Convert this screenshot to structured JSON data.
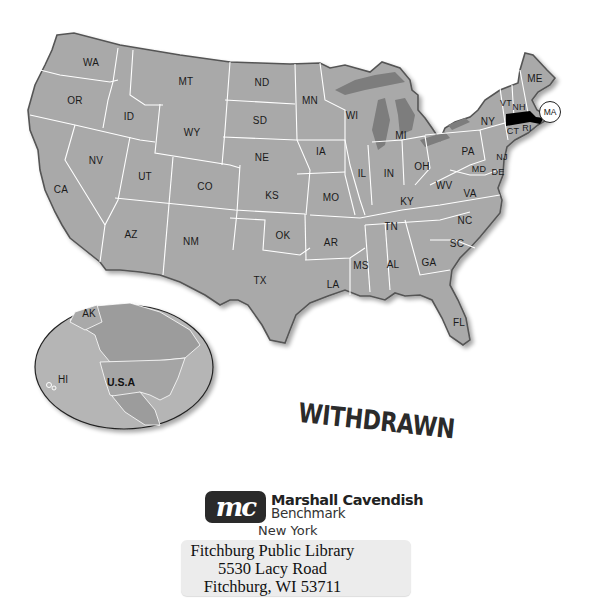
{
  "map": {
    "title": "United States",
    "states": [
      {
        "abbr": "WA",
        "x": 91,
        "y": 62
      },
      {
        "abbr": "OR",
        "x": 75,
        "y": 100
      },
      {
        "abbr": "ID",
        "x": 129,
        "y": 116
      },
      {
        "abbr": "MT",
        "x": 186,
        "y": 81
      },
      {
        "abbr": "ND",
        "x": 262,
        "y": 82
      },
      {
        "abbr": "SD",
        "x": 260,
        "y": 120
      },
      {
        "abbr": "WY",
        "x": 192,
        "y": 132
      },
      {
        "abbr": "NE",
        "x": 262,
        "y": 157
      },
      {
        "abbr": "NV",
        "x": 96,
        "y": 160
      },
      {
        "abbr": "UT",
        "x": 145,
        "y": 176
      },
      {
        "abbr": "CO",
        "x": 205,
        "y": 186
      },
      {
        "abbr": "KS",
        "x": 272,
        "y": 195
      },
      {
        "abbr": "CA",
        "x": 61,
        "y": 189
      },
      {
        "abbr": "AZ",
        "x": 131,
        "y": 234
      },
      {
        "abbr": "NM",
        "x": 191,
        "y": 241
      },
      {
        "abbr": "OK",
        "x": 283,
        "y": 235
      },
      {
        "abbr": "TX",
        "x": 260,
        "y": 280
      },
      {
        "abbr": "MN",
        "x": 310,
        "y": 100
      },
      {
        "abbr": "WI",
        "x": 352,
        "y": 115
      },
      {
        "abbr": "MI",
        "x": 401,
        "y": 135
      },
      {
        "abbr": "IA",
        "x": 321,
        "y": 151
      },
      {
        "abbr": "IL",
        "x": 362,
        "y": 173
      },
      {
        "abbr": "IN",
        "x": 389,
        "y": 173
      },
      {
        "abbr": "OH",
        "x": 422,
        "y": 166
      },
      {
        "abbr": "MO",
        "x": 331,
        "y": 197
      },
      {
        "abbr": "KY",
        "x": 407,
        "y": 201
      },
      {
        "abbr": "WV",
        "x": 444,
        "y": 185
      },
      {
        "abbr": "VA",
        "x": 470,
        "y": 193
      },
      {
        "abbr": "PA",
        "x": 468,
        "y": 151
      },
      {
        "abbr": "NY",
        "x": 488,
        "y": 121
      },
      {
        "abbr": "TN",
        "x": 391,
        "y": 226
      },
      {
        "abbr": "NC",
        "x": 465,
        "y": 220
      },
      {
        "abbr": "AR",
        "x": 331,
        "y": 242
      },
      {
        "abbr": "MS",
        "x": 361,
        "y": 265
      },
      {
        "abbr": "AL",
        "x": 393,
        "y": 264
      },
      {
        "abbr": "GA",
        "x": 429,
        "y": 262
      },
      {
        "abbr": "SC",
        "x": 457,
        "y": 243
      },
      {
        "abbr": "LA",
        "x": 333,
        "y": 284
      },
      {
        "abbr": "FL",
        "x": 459,
        "y": 322
      },
      {
        "abbr": "ME",
        "x": 535,
        "y": 78
      },
      {
        "abbr": "VT",
        "x": 506,
        "y": 103
      },
      {
        "abbr": "NH",
        "x": 519,
        "y": 107
      },
      {
        "abbr": "CT",
        "x": 513,
        "y": 131
      },
      {
        "abbr": "RI",
        "x": 527,
        "y": 128
      },
      {
        "abbr": "NJ",
        "x": 502,
        "y": 157
      },
      {
        "abbr": "MD",
        "x": 479,
        "y": 169
      },
      {
        "abbr": "DE",
        "x": 498,
        "y": 172
      }
    ],
    "highlighted_state": {
      "abbr": "MA",
      "callout_label": "MA",
      "color": "#000000"
    },
    "colors": {
      "land": "#a9a9a9",
      "border": "#ffffff",
      "outline": "#555555",
      "lakes": "#7d7d7d",
      "highlight": "#000000"
    }
  },
  "inset_globe": {
    "labels": [
      {
        "text": "AK",
        "x": 89,
        "y": 313
      },
      {
        "text": "HI",
        "x": 63,
        "y": 379
      }
    ],
    "country_label": "U.S.A",
    "colors": {
      "ocean": "#b5b5b5",
      "land": "#9c9c9c",
      "usa": "#a5a5a5"
    }
  },
  "stamp": {
    "text": "WITHDRAWN"
  },
  "publisher": {
    "logo_text": "mc",
    "name": "Marshall Cavendish",
    "imprint": "Benchmark",
    "city": "New York"
  },
  "library_label": {
    "line1": "Fitchburg Public Library",
    "line2": "5530 Lacy Road",
    "line3": "Fitchburg, WI 53711"
  }
}
